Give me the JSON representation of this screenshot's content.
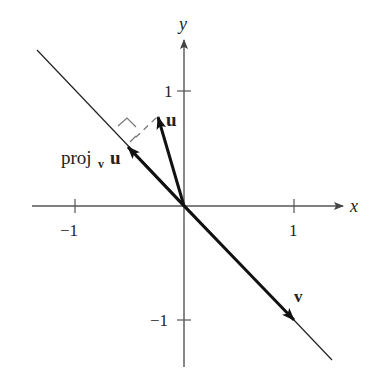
{
  "diagram": {
    "axes": {
      "x_label": "x",
      "y_label": "y",
      "x_ticks": [
        {
          "value": -1,
          "label": "−1"
        },
        {
          "value": 1,
          "label": "1"
        }
      ],
      "y_ticks": [
        {
          "value": 1,
          "label": "1"
        },
        {
          "value": -1,
          "label": "−1"
        }
      ]
    },
    "vectors": {
      "u": {
        "label": "u"
      },
      "v": {
        "label": "v"
      },
      "proj": {
        "label_main": "proj",
        "label_sub": "v",
        "label_vec": "u"
      }
    },
    "colors": {
      "axis": "#555555",
      "vector": "#111111",
      "dashed": "#777777"
    }
  }
}
